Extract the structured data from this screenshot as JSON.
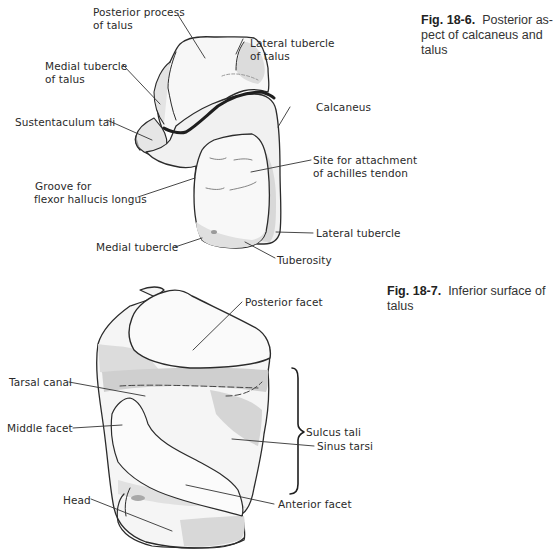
{
  "figures": [
    {
      "id": "fig-18-6",
      "caption": {
        "number": "Fig. 18-6.",
        "line1": "Posterior as-",
        "line2": "pect of calcaneus and",
        "line3": "talus"
      },
      "labels": {
        "posterior_process_1": "Posterior process",
        "posterior_process_2": "of talus",
        "lateral_tubercle_talus_1": "Lateral tubercle",
        "lateral_tubercle_talus_2": "of talus",
        "medial_tubercle_talus_1": "Medial tubercle",
        "medial_tubercle_talus_2": "of talus",
        "calcaneus": "Calcaneus",
        "sustentaculum_tali": "Sustentaculum tali",
        "site_achilles_1": "Site for attachment",
        "site_achilles_2": "of achilles tendon",
        "groove_fhl_1": "Groove for",
        "groove_fhl_2": "flexor hallucis longus",
        "medial_tubercle": "Medial tubercle",
        "lateral_tubercle": "Lateral tubercle",
        "tuberosity": "Tuberosity"
      }
    },
    {
      "id": "fig-18-7",
      "caption": {
        "number": "Fig. 18-7.",
        "line1": "Inferior surface of",
        "line2": "talus"
      },
      "labels": {
        "posterior_facet": "Posterior facet",
        "tarsal_canal": "Tarsal canal",
        "middle_facet": "Middle facet",
        "sulcus_tali": "Sulcus tali",
        "sinus_tarsi": "Sinus tarsi",
        "head": "Head",
        "anterior_facet": "Anterior facet"
      }
    }
  ],
  "colors": {
    "outline": "#2b2b2b",
    "shade_light": "#ececec",
    "shade_mid": "#d6d6d6",
    "shade_dark": "#bdbdbd",
    "label_text": "#2a2a2a"
  }
}
